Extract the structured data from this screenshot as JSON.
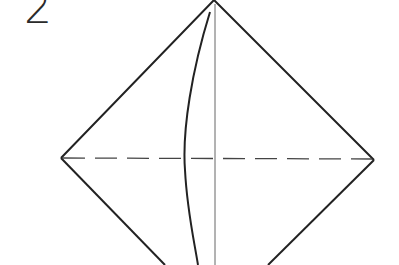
{
  "diagram": {
    "step_number": "2",
    "shape": "diamond (square rotated 45°)",
    "elements": [
      {
        "name": "diamond-outline",
        "style": "solid"
      },
      {
        "name": "horizontal-fold-line",
        "style": "dashed",
        "meaning": "valley fold"
      },
      {
        "name": "vertical-crease-line",
        "style": "thin solid",
        "meaning": "existing crease"
      },
      {
        "name": "curved-fold-line",
        "style": "solid curve",
        "meaning": "folded edge"
      }
    ],
    "colors": {
      "line": "#222222",
      "crease": "#555555",
      "background": "#ffffff"
    }
  }
}
